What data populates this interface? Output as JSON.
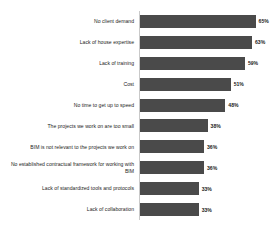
{
  "chart_data": {
    "type": "bar",
    "orientation": "horizontal",
    "title": "",
    "subtitle": "",
    "xlabel": "",
    "ylabel": "",
    "xlim": [
      0,
      72
    ],
    "grid": false,
    "legend": null,
    "value_suffix": "%",
    "bar_color": "#4a4a4a",
    "axis_color": "#c9c9c9",
    "categories": [
      "No client demand",
      "Lack of house expertise",
      "Lack of training",
      "Cost",
      "No time to get up to speed",
      "The projects we work on are too small",
      "BIM is not relevant to the projects we work on",
      "No established contractual framework for working with BIM",
      "Lack of standardized tools and protocols",
      "Lack of collaboration"
    ],
    "values": [
      65,
      63,
      59,
      51,
      48,
      38,
      36,
      36,
      33,
      33
    ],
    "labels": [
      "65%",
      "63%",
      "59%",
      "51%",
      "48%",
      "38%",
      "36%",
      "36%",
      "33%",
      "33%"
    ]
  },
  "bars": [
    {
      "label": "No client demand",
      "value": 65,
      "value_label": "65%"
    },
    {
      "label": "Lack of house expertise",
      "value": 63,
      "value_label": "63%"
    },
    {
      "label": "Lack of training",
      "value": 59,
      "value_label": "59%"
    },
    {
      "label": "Cost",
      "value": 51,
      "value_label": "51%"
    },
    {
      "label": "No time to get up to speed",
      "value": 48,
      "value_label": "48%"
    },
    {
      "label": "The projects we work on are too small",
      "value": 38,
      "value_label": "38%"
    },
    {
      "label": "BIM is not relevant to the projects we work on",
      "value": 36,
      "value_label": "36%"
    },
    {
      "label": "No established contractual framework for working with BIM",
      "value": 36,
      "value_label": "36%"
    },
    {
      "label": "Lack of standardized tools and protocols",
      "value": 33,
      "value_label": "33%"
    },
    {
      "label": "Lack of collaboration",
      "value": 33,
      "value_label": "33%"
    }
  ]
}
